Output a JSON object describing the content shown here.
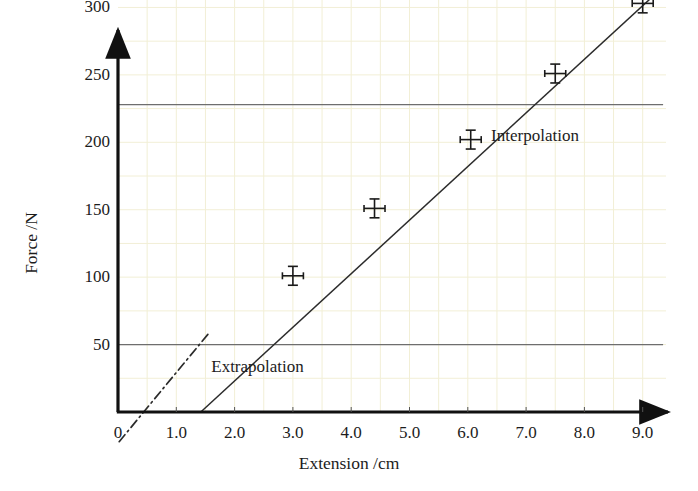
{
  "chart_data": {
    "type": "scatter",
    "title": "",
    "xlabel": "Extension /cm",
    "ylabel": "Force /N",
    "xlim": [
      0,
      9.4
    ],
    "ylim": [
      0,
      330
    ],
    "grid": true,
    "grid_x_step": 0.5,
    "grid_y_step": 25,
    "legend": "none",
    "x_tick_labels": [
      "0",
      "1.0",
      "2.0",
      "3.0",
      "4.0",
      "5.0",
      "6.0",
      "7.0",
      "8.0",
      "9.0"
    ],
    "x_tick_values": [
      0,
      1.0,
      2.0,
      3.0,
      4.0,
      5.0,
      6.0,
      7.0,
      8.0,
      9.0
    ],
    "y_tick_labels": [
      "50",
      "100",
      "150",
      "200",
      "250",
      "300"
    ],
    "y_tick_values": [
      50,
      100,
      150,
      200,
      250,
      300
    ],
    "points": [
      {
        "x": 3.0,
        "y": 101,
        "xerr": 0.18,
        "yerr": 7
      },
      {
        "x": 4.4,
        "y": 151,
        "xerr": 0.18,
        "yerr": 7
      },
      {
        "x": 6.05,
        "y": 202,
        "xerr": 0.18,
        "yerr": 7
      },
      {
        "x": 7.5,
        "y": 251,
        "xerr": 0.18,
        "yerr": 7
      },
      {
        "x": 9.0,
        "y": 303,
        "xerr": 0.18,
        "yerr": 7
      }
    ],
    "fit_line": {
      "x_start": 1.42,
      "y_start": 0,
      "x_end": 9.42,
      "y_end": 318,
      "style": "solid"
    },
    "extrapolation_segment": {
      "x_start": 0.02,
      "y_start": -22,
      "x_end": 1.55,
      "y_end": 58,
      "style": "dash-dot"
    },
    "reference_lines": [
      {
        "name": "extrapolation-reference",
        "y": 50,
        "x_start": 0,
        "x_end": 9.35
      },
      {
        "name": "interpolation-reference",
        "y": 228,
        "x_start": 0,
        "x_end": 9.35
      }
    ],
    "annotations": [
      {
        "name": "interpolation",
        "text": "Interpolation",
        "x": 6.4,
        "y": 205
      },
      {
        "name": "extrapolation",
        "text": "Extrapolation",
        "x": 1.6,
        "y": 33
      }
    ]
  },
  "colors": {
    "axis": "#111111",
    "grid": "#f2efd6",
    "reference_line": "#6e6e6e",
    "fit_line": "#2b2b2b",
    "marker": "#1a1a1a",
    "background": "#ffffff"
  }
}
